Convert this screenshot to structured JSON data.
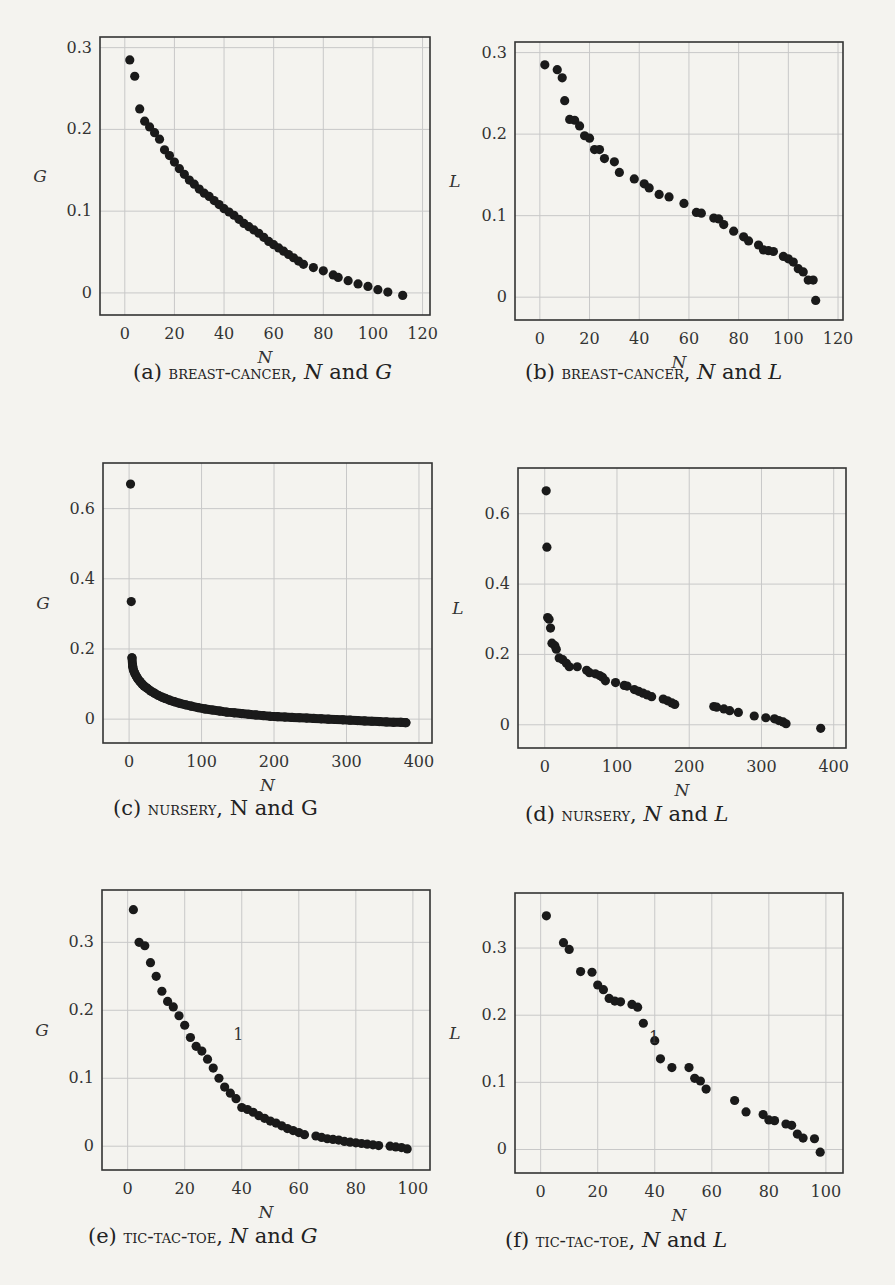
{
  "figure": {
    "panels": [
      {
        "id": "a",
        "caption_prefix": "(a)",
        "dataset": "breast-cancer",
        "caption_suffix": "N and G",
        "ylabel": "G",
        "xlabel": "N"
      },
      {
        "id": "b",
        "caption_prefix": "(b)",
        "dataset": "breast-cancer",
        "caption_suffix": "N and L",
        "ylabel": "L",
        "xlabel": "N"
      },
      {
        "id": "c",
        "caption_prefix": "(c)",
        "dataset": "nursery",
        "caption_suffix": "N and G",
        "ylabel": "G",
        "xlabel": "N"
      },
      {
        "id": "d",
        "caption_prefix": "(d)",
        "dataset": "nursery",
        "caption_suffix": "N and L",
        "ylabel": "L",
        "xlabel": "N"
      },
      {
        "id": "e",
        "caption_prefix": "(e)",
        "dataset": "tic-tac-toe",
        "caption_suffix": "N and G",
        "ylabel": "G",
        "xlabel": "N"
      },
      {
        "id": "f",
        "caption_prefix": "(f)",
        "dataset": "tic-tac-toe",
        "caption_suffix": "N and L",
        "ylabel": "L",
        "xlabel": "N"
      }
    ]
  },
  "chart_data": [
    {
      "id": "a",
      "type": "scatter",
      "title": "(a) breast-cancer, N and G",
      "xlabel": "N",
      "ylabel": "G",
      "grid": true,
      "xlim": [
        -10,
        123
      ],
      "ylim": [
        -0.027,
        0.313
      ],
      "xticks": [
        0,
        20,
        40,
        60,
        80,
        100,
        120
      ],
      "yticks": [
        0,
        0.1,
        0.2,
        0.3
      ],
      "ytick_labels": [
        "0",
        "0.1",
        "0.2",
        "0.3"
      ],
      "points": [
        [
          2,
          0.285
        ],
        [
          4,
          0.265
        ],
        [
          6,
          0.225
        ],
        [
          8,
          0.21
        ],
        [
          10,
          0.203
        ],
        [
          12,
          0.196
        ],
        [
          14,
          0.188
        ],
        [
          16,
          0.175
        ],
        [
          18,
          0.168
        ],
        [
          20,
          0.16
        ],
        [
          22,
          0.152
        ],
        [
          24,
          0.145
        ],
        [
          26,
          0.138
        ],
        [
          28,
          0.133
        ],
        [
          30,
          0.127
        ],
        [
          32,
          0.122
        ],
        [
          34,
          0.118
        ],
        [
          36,
          0.113
        ],
        [
          38,
          0.108
        ],
        [
          40,
          0.103
        ],
        [
          42,
          0.099
        ],
        [
          44,
          0.095
        ],
        [
          46,
          0.09
        ],
        [
          48,
          0.085
        ],
        [
          50,
          0.081
        ],
        [
          52,
          0.077
        ],
        [
          54,
          0.073
        ],
        [
          56,
          0.068
        ],
        [
          58,
          0.063
        ],
        [
          60,
          0.059
        ],
        [
          62,
          0.055
        ],
        [
          64,
          0.051
        ],
        [
          66,
          0.047
        ],
        [
          68,
          0.043
        ],
        [
          70,
          0.039
        ],
        [
          72,
          0.035
        ],
        [
          76,
          0.031
        ],
        [
          80,
          0.027
        ],
        [
          84,
          0.022
        ],
        [
          86,
          0.019
        ],
        [
          90,
          0.015
        ],
        [
          94,
          0.011
        ],
        [
          98,
          0.008
        ],
        [
          102,
          0.004
        ],
        [
          106,
          0.001
        ],
        [
          112,
          -0.003
        ]
      ],
      "annotations": []
    },
    {
      "id": "b",
      "type": "scatter",
      "title": "(b) breast-cancer, N and L",
      "xlabel": "N",
      "ylabel": "L",
      "grid": true,
      "xlim": [
        -10,
        122
      ],
      "ylim": [
        -0.028,
        0.313
      ],
      "xticks": [
        0,
        20,
        40,
        60,
        80,
        100,
        120
      ],
      "yticks": [
        0,
        0.1,
        0.2,
        0.3
      ],
      "ytick_labels": [
        "0",
        "0.1",
        "0.2",
        "0.3"
      ],
      "points": [
        [
          2,
          0.285
        ],
        [
          7,
          0.279
        ],
        [
          9,
          0.269
        ],
        [
          10,
          0.241
        ],
        [
          12,
          0.218
        ],
        [
          14,
          0.217
        ],
        [
          16,
          0.21
        ],
        [
          18,
          0.198
        ],
        [
          20,
          0.195
        ],
        [
          22,
          0.181
        ],
        [
          24,
          0.181
        ],
        [
          26,
          0.17
        ],
        [
          30,
          0.166
        ],
        [
          32,
          0.153
        ],
        [
          38,
          0.145
        ],
        [
          42,
          0.139
        ],
        [
          44,
          0.134
        ],
        [
          48,
          0.126
        ],
        [
          52,
          0.123
        ],
        [
          58,
          0.115
        ],
        [
          63,
          0.104
        ],
        [
          65,
          0.103
        ],
        [
          70,
          0.097
        ],
        [
          72,
          0.096
        ],
        [
          74,
          0.089
        ],
        [
          78,
          0.081
        ],
        [
          82,
          0.074
        ],
        [
          84,
          0.069
        ],
        [
          88,
          0.064
        ],
        [
          90,
          0.058
        ],
        [
          92,
          0.057
        ],
        [
          94,
          0.056
        ],
        [
          98,
          0.05
        ],
        [
          100,
          0.047
        ],
        [
          102,
          0.043
        ],
        [
          104,
          0.035
        ],
        [
          106,
          0.031
        ],
        [
          108,
          0.021
        ],
        [
          110,
          0.021
        ],
        [
          111,
          -0.004
        ]
      ],
      "annotations": []
    },
    {
      "id": "c",
      "type": "scatter",
      "title": "(c) nursery, N and G",
      "xlabel": "N",
      "ylabel": "G",
      "grid": true,
      "xlim": [
        -36,
        418
      ],
      "ylim": [
        -0.068,
        0.73
      ],
      "xticks": [
        0,
        100,
        200,
        300,
        400
      ],
      "yticks": [
        0,
        0.2,
        0.4,
        0.6
      ],
      "ytick_labels": [
        "0",
        "0.2",
        "0.4",
        "0.6"
      ],
      "points": [
        [
          2,
          0.67
        ],
        [
          3,
          0.335
        ],
        [
          4,
          0.175
        ],
        [
          5,
          0.15
        ],
        [
          6,
          0.14
        ],
        [
          8,
          0.13
        ],
        [
          10,
          0.122
        ],
        [
          12,
          0.115
        ],
        [
          15,
          0.107
        ],
        [
          18,
          0.1
        ],
        [
          21,
          0.094
        ],
        [
          25,
          0.088
        ],
        [
          30,
          0.08
        ],
        [
          35,
          0.074
        ],
        [
          40,
          0.068
        ],
        [
          45,
          0.063
        ],
        [
          50,
          0.059
        ],
        [
          56,
          0.054
        ],
        [
          62,
          0.05
        ],
        [
          70,
          0.045
        ],
        [
          78,
          0.041
        ],
        [
          86,
          0.037
        ],
        [
          95,
          0.033
        ],
        [
          105,
          0.029
        ],
        [
          115,
          0.026
        ],
        [
          125,
          0.023
        ],
        [
          135,
          0.02
        ],
        [
          145,
          0.018
        ],
        [
          155,
          0.016
        ],
        [
          165,
          0.014
        ],
        [
          175,
          0.012
        ],
        [
          185,
          0.01
        ],
        [
          195,
          0.008
        ],
        [
          205,
          0.007
        ],
        [
          215,
          0.006
        ],
        [
          225,
          0.005
        ],
        [
          235,
          0.004
        ],
        [
          245,
          0.003
        ],
        [
          255,
          0.002
        ],
        [
          265,
          0.001
        ],
        [
          275,
          0.0
        ],
        [
          285,
          -0.001
        ],
        [
          295,
          -0.002
        ],
        [
          305,
          -0.003
        ],
        [
          315,
          -0.004
        ],
        [
          325,
          -0.005
        ],
        [
          335,
          -0.006
        ],
        [
          345,
          -0.007
        ],
        [
          355,
          -0.008
        ],
        [
          365,
          -0.009
        ],
        [
          375,
          -0.009
        ],
        [
          382,
          -0.01
        ]
      ],
      "dense_fill": true,
      "annotations": []
    },
    {
      "id": "d",
      "type": "scatter",
      "title": "(d) nursery, N and L",
      "xlabel": "N",
      "ylabel": "L",
      "grid": true,
      "xlim": [
        -37,
        417
      ],
      "ylim": [
        -0.066,
        0.73
      ],
      "xticks": [
        0,
        100,
        200,
        300,
        400
      ],
      "yticks": [
        0,
        0.2,
        0.4,
        0.6
      ],
      "ytick_labels": [
        "0",
        "0.2",
        "0.4",
        "0.6"
      ],
      "points": [
        [
          2,
          0.665
        ],
        [
          3,
          0.505
        ],
        [
          4,
          0.305
        ],
        [
          6,
          0.3
        ],
        [
          8,
          0.275
        ],
        [
          10,
          0.232
        ],
        [
          14,
          0.225
        ],
        [
          16,
          0.215
        ],
        [
          20,
          0.19
        ],
        [
          25,
          0.185
        ],
        [
          30,
          0.175
        ],
        [
          34,
          0.165
        ],
        [
          45,
          0.165
        ],
        [
          58,
          0.155
        ],
        [
          62,
          0.148
        ],
        [
          70,
          0.145
        ],
        [
          76,
          0.14
        ],
        [
          80,
          0.135
        ],
        [
          84,
          0.125
        ],
        [
          98,
          0.12
        ],
        [
          110,
          0.112
        ],
        [
          114,
          0.11
        ],
        [
          124,
          0.1
        ],
        [
          130,
          0.095
        ],
        [
          136,
          0.09
        ],
        [
          142,
          0.085
        ],
        [
          148,
          0.08
        ],
        [
          164,
          0.073
        ],
        [
          170,
          0.068
        ],
        [
          176,
          0.062
        ],
        [
          180,
          0.058
        ],
        [
          234,
          0.052
        ],
        [
          238,
          0.05
        ],
        [
          248,
          0.045
        ],
        [
          256,
          0.04
        ],
        [
          268,
          0.035
        ],
        [
          290,
          0.025
        ],
        [
          306,
          0.02
        ],
        [
          318,
          0.017
        ],
        [
          324,
          0.012
        ],
        [
          330,
          0.008
        ],
        [
          334,
          0.003
        ],
        [
          382,
          -0.01
        ]
      ],
      "annotations": []
    },
    {
      "id": "e",
      "type": "scatter",
      "title": "(e) tic-tac-toe, N and G",
      "xlabel": "N",
      "ylabel": "G",
      "grid": true,
      "xlim": [
        -9,
        106
      ],
      "ylim": [
        -0.035,
        0.377
      ],
      "xticks": [
        0,
        20,
        40,
        60,
        80,
        100
      ],
      "yticks": [
        0,
        0.1,
        0.2,
        0.3
      ],
      "ytick_labels": [
        "0",
        "0.1",
        "0.2",
        "0.3"
      ],
      "points": [
        [
          2,
          0.348
        ],
        [
          4,
          0.3
        ],
        [
          6,
          0.295
        ],
        [
          8,
          0.27
        ],
        [
          10,
          0.25
        ],
        [
          12,
          0.228
        ],
        [
          14,
          0.213
        ],
        [
          16,
          0.205
        ],
        [
          18,
          0.192
        ],
        [
          20,
          0.178
        ],
        [
          22,
          0.16
        ],
        [
          24,
          0.147
        ],
        [
          26,
          0.14
        ],
        [
          28,
          0.128
        ],
        [
          30,
          0.115
        ],
        [
          32,
          0.1
        ],
        [
          34,
          0.087
        ],
        [
          36,
          0.078
        ],
        [
          38,
          0.07
        ],
        [
          40,
          0.057
        ],
        [
          42,
          0.054
        ],
        [
          44,
          0.05
        ],
        [
          46,
          0.045
        ],
        [
          48,
          0.041
        ],
        [
          50,
          0.037
        ],
        [
          52,
          0.034
        ],
        [
          54,
          0.03
        ],
        [
          56,
          0.026
        ],
        [
          58,
          0.023
        ],
        [
          60,
          0.02
        ],
        [
          62,
          0.017
        ],
        [
          66,
          0.015
        ],
        [
          68,
          0.013
        ],
        [
          70,
          0.011
        ],
        [
          72,
          0.01
        ],
        [
          74,
          0.009
        ],
        [
          76,
          0.007
        ],
        [
          78,
          0.006
        ],
        [
          80,
          0.005
        ],
        [
          82,
          0.004
        ],
        [
          84,
          0.003
        ],
        [
          86,
          0.002
        ],
        [
          88,
          0.001
        ],
        [
          92,
          0.0
        ],
        [
          94,
          -0.001
        ],
        [
          96,
          -0.002
        ],
        [
          98,
          -0.004
        ]
      ],
      "annotations": [
        {
          "text": "1",
          "x": 37,
          "y": 0.165
        }
      ]
    },
    {
      "id": "f",
      "type": "scatter",
      "title": "(f) tic-tac-toe, N and L",
      "xlabel": "N",
      "ylabel": "L",
      "grid": true,
      "xlim": [
        -9,
        106
      ],
      "ylim": [
        -0.035,
        0.382
      ],
      "xticks": [
        0,
        20,
        40,
        60,
        80,
        100
      ],
      "yticks": [
        0,
        0.1,
        0.2,
        0.3
      ],
      "ytick_labels": [
        "0",
        "0.1",
        "0.2",
        "0.3"
      ],
      "points": [
        [
          2,
          0.348
        ],
        [
          8,
          0.308
        ],
        [
          10,
          0.298
        ],
        [
          14,
          0.265
        ],
        [
          18,
          0.264
        ],
        [
          20,
          0.245
        ],
        [
          22,
          0.238
        ],
        [
          24,
          0.225
        ],
        [
          26,
          0.221
        ],
        [
          28,
          0.22
        ],
        [
          32,
          0.216
        ],
        [
          34,
          0.212
        ],
        [
          36,
          0.188
        ],
        [
          40,
          0.162
        ],
        [
          42,
          0.135
        ],
        [
          46,
          0.122
        ],
        [
          52,
          0.122
        ],
        [
          54,
          0.106
        ],
        [
          56,
          0.102
        ],
        [
          58,
          0.09
        ],
        [
          68,
          0.073
        ],
        [
          72,
          0.056
        ],
        [
          78,
          0.052
        ],
        [
          80,
          0.044
        ],
        [
          82,
          0.043
        ],
        [
          86,
          0.038
        ],
        [
          88,
          0.036
        ],
        [
          90,
          0.023
        ],
        [
          92,
          0.017
        ],
        [
          96,
          0.016
        ],
        [
          98,
          -0.004
        ]
      ],
      "annotations": [
        {
          "text": "1",
          "x": 38,
          "y": 0.168
        }
      ]
    }
  ]
}
